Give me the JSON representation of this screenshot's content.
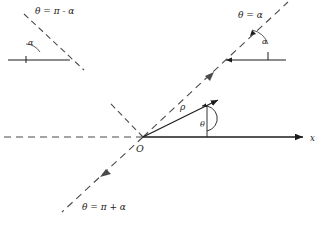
{
  "figure": {
    "title": "",
    "origin_label": "O",
    "axis_x_label": "x",
    "radius_label": "ρ",
    "angle_label": "θ",
    "annotations": {
      "top_left": "θ = π - α",
      "top_right": "θ = α",
      "bottom_left": "θ = π + α"
    },
    "inset_left": {
      "angle_label": "α"
    },
    "inset_right": {
      "angle_label": "α"
    },
    "colors": {
      "ink": "#1c1c1c",
      "dash": "#4a4a4a",
      "background": "#ffffff"
    }
  }
}
